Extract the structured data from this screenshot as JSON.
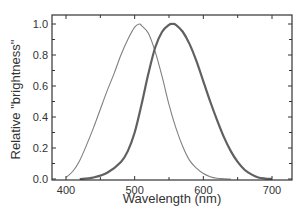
{
  "chart_data": {
    "type": "line",
    "title": "",
    "xlabel": "Wavelength  (nm)",
    "ylabel": "Relative  \"brightness\"",
    "xlim": [
      380,
      730
    ],
    "ylim": [
      0.0,
      1.05
    ],
    "xticks": [
      400,
      500,
      600,
      700
    ],
    "xtick_labels": [
      "400",
      "500",
      "600",
      "700"
    ],
    "xminor_step": 50,
    "yticks": [
      0.0,
      0.2,
      0.4,
      0.6,
      0.8,
      1.0
    ],
    "ytick_labels": [
      "0.0",
      "0.2",
      "0.4",
      "0.6",
      "0.8",
      "1.0"
    ],
    "yminor_step": 0.1,
    "grid": false,
    "legend": "none",
    "series": [
      {
        "name": "scotopic (rod) sensitivity",
        "style": "thin",
        "color": "#808080",
        "x": [
          400,
          410,
          420,
          430,
          440,
          450,
          460,
          470,
          480,
          490,
          500,
          507,
          510,
          520,
          530,
          540,
          550,
          560,
          570,
          580,
          590,
          600,
          610,
          620,
          630,
          640
        ],
        "y": [
          0.01,
          0.05,
          0.12,
          0.22,
          0.33,
          0.45,
          0.57,
          0.68,
          0.8,
          0.9,
          0.98,
          1.0,
          0.99,
          0.94,
          0.82,
          0.66,
          0.48,
          0.33,
          0.21,
          0.12,
          0.07,
          0.035,
          0.015,
          0.005,
          0.002,
          0.0
        ]
      },
      {
        "name": "photopic (cone) sensitivity",
        "style": "thick",
        "color": "#606060",
        "x": [
          420,
          440,
          460,
          480,
          490,
          500,
          510,
          520,
          530,
          540,
          550,
          555,
          560,
          570,
          580,
          590,
          600,
          610,
          620,
          630,
          640,
          650,
          660,
          670,
          680,
          690,
          700
        ],
        "y": [
          0.0,
          0.01,
          0.04,
          0.11,
          0.18,
          0.3,
          0.48,
          0.68,
          0.85,
          0.95,
          0.995,
          1.0,
          0.995,
          0.95,
          0.87,
          0.76,
          0.63,
          0.5,
          0.38,
          0.27,
          0.18,
          0.11,
          0.06,
          0.03,
          0.01,
          0.003,
          0.0
        ]
      }
    ]
  }
}
